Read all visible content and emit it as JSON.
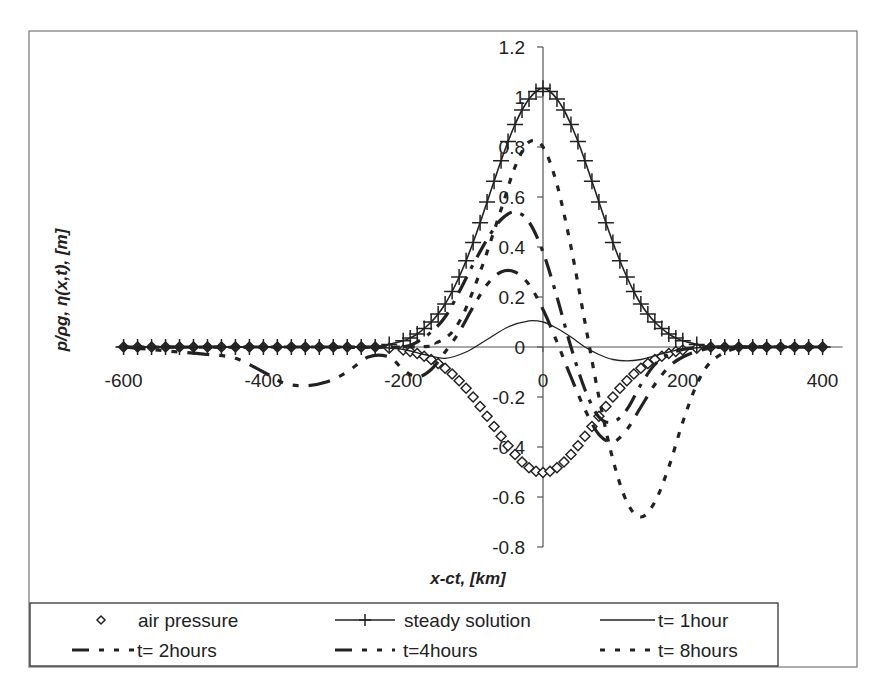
{
  "chart_data": {
    "type": "line",
    "title": "",
    "xlabel": "x-ct,  [km]",
    "ylabel": "p/ρg,  η(x,t),  [m]",
    "xlim": [
      -600,
      400
    ],
    "ylim": [
      -0.8,
      1.2
    ],
    "x_ticks": [
      -600,
      -400,
      -200,
      0,
      200,
      400
    ],
    "x_tick_labels": [
      "-600",
      "-400",
      "-200",
      "0",
      "200",
      "400"
    ],
    "y_ticks": [
      -0.8,
      -0.6,
      -0.4,
      -0.2,
      0,
      0.2,
      0.4,
      0.6,
      0.8,
      1,
      1.2
    ],
    "y_tick_labels": [
      "-0.8",
      "-0.6",
      "-0.4",
      "-0.2",
      "0",
      "0.2",
      "0.4",
      "0.6",
      "0.8",
      "1",
      "1.2"
    ],
    "grid": false,
    "legend_position": "bottom",
    "series": [
      {
        "name": "air pressure",
        "style": "diamond-markers",
        "x": [
          -600,
          -580,
          -560,
          -540,
          -520,
          -500,
          -480,
          -460,
          -440,
          -420,
          -400,
          -380,
          -360,
          -340,
          -320,
          -300,
          -280,
          -260,
          -240,
          -220,
          -200,
          -190,
          -180,
          -170,
          -160,
          -150,
          -140,
          -130,
          -120,
          -110,
          -100,
          -90,
          -80,
          -70,
          -60,
          -50,
          -40,
          -30,
          -20,
          -10,
          0,
          10,
          20,
          30,
          40,
          50,
          60,
          70,
          80,
          90,
          100,
          110,
          120,
          130,
          140,
          150,
          160,
          170,
          180,
          190,
          200,
          220,
          240,
          260,
          280,
          300,
          320,
          340,
          360,
          380,
          400
        ],
        "y": [
          0,
          0,
          0,
          0,
          0,
          0,
          0,
          0,
          0,
          0,
          0,
          0,
          0,
          0,
          0,
          0,
          0,
          0,
          0,
          -0.005,
          -0.012,
          -0.018,
          -0.026,
          -0.037,
          -0.05,
          -0.066,
          -0.085,
          -0.108,
          -0.135,
          -0.165,
          -0.2,
          -0.238,
          -0.277,
          -0.318,
          -0.357,
          -0.395,
          -0.43,
          -0.46,
          -0.483,
          -0.497,
          -0.502,
          -0.497,
          -0.483,
          -0.46,
          -0.43,
          -0.395,
          -0.357,
          -0.318,
          -0.277,
          -0.238,
          -0.2,
          -0.165,
          -0.135,
          -0.108,
          -0.085,
          -0.066,
          -0.05,
          -0.037,
          -0.026,
          -0.018,
          -0.012,
          -0.005,
          0,
          0,
          0,
          0,
          0,
          0,
          0,
          0,
          0
        ]
      },
      {
        "name": "steady solution",
        "style": "solid-plus-markers",
        "x": [
          -600,
          -580,
          -560,
          -540,
          -520,
          -500,
          -480,
          -460,
          -440,
          -420,
          -400,
          -380,
          -360,
          -340,
          -320,
          -300,
          -280,
          -260,
          -240,
          -220,
          -200,
          -190,
          -180,
          -170,
          -160,
          -150,
          -140,
          -130,
          -120,
          -110,
          -100,
          -90,
          -80,
          -70,
          -60,
          -50,
          -40,
          -30,
          -20,
          -10,
          0,
          10,
          20,
          30,
          40,
          50,
          60,
          70,
          80,
          90,
          100,
          110,
          120,
          130,
          140,
          150,
          160,
          170,
          180,
          190,
          200,
          220,
          240,
          260,
          280,
          300,
          320,
          340,
          360,
          380,
          400
        ],
        "y": [
          0,
          0,
          0,
          0,
          0,
          0,
          0,
          0,
          0,
          0,
          0,
          0,
          0,
          0,
          0,
          0,
          0,
          0,
          0,
          0.01,
          0.025,
          0.036,
          0.052,
          0.074,
          0.1,
          0.132,
          0.172,
          0.222,
          0.28,
          0.345,
          0.418,
          0.497,
          0.58,
          0.663,
          0.745,
          0.822,
          0.89,
          0.948,
          0.992,
          1.022,
          1.035,
          1.022,
          0.992,
          0.948,
          0.89,
          0.822,
          0.745,
          0.663,
          0.58,
          0.497,
          0.418,
          0.345,
          0.28,
          0.222,
          0.172,
          0.132,
          0.1,
          0.074,
          0.052,
          0.036,
          0.025,
          0.01,
          0,
          0,
          0,
          0,
          0,
          0,
          0,
          0,
          0
        ]
      },
      {
        "name": "t= 1hour",
        "style": "solid-thin",
        "x": [
          -600,
          -400,
          -250,
          -200,
          -170,
          -140,
          -110,
          -80,
          -50,
          -20,
          0,
          20,
          40,
          60,
          80,
          100,
          120,
          140,
          160,
          180,
          200,
          240,
          300,
          400
        ],
        "y": [
          0,
          0,
          0,
          -0.01,
          -0.03,
          -0.045,
          -0.02,
          0.03,
          0.08,
          0.105,
          0.1,
          0.075,
          0.04,
          0.0,
          -0.03,
          -0.05,
          -0.055,
          -0.05,
          -0.035,
          -0.02,
          -0.008,
          0,
          0,
          0
        ]
      },
      {
        "name": "t= 2hours",
        "style": "long-dash-short-dash",
        "x": [
          -600,
          -560,
          -520,
          -480,
          -440,
          -400,
          -370,
          -340,
          -310,
          -280,
          -250,
          -220,
          -200,
          -180,
          -160,
          -140,
          -120,
          -100,
          -80,
          -60,
          -40,
          -20,
          0,
          20,
          40,
          60,
          80,
          100,
          120,
          140,
          160,
          180,
          200,
          230,
          260,
          300,
          400
        ],
        "y": [
          0,
          -0.01,
          -0.02,
          -0.03,
          -0.045,
          -0.1,
          -0.145,
          -0.155,
          -0.14,
          -0.1,
          -0.04,
          -0.04,
          -0.09,
          -0.12,
          -0.09,
          -0.02,
          0.06,
          0.16,
          0.25,
          0.3,
          0.3,
          0.25,
          0.15,
          0.02,
          -0.12,
          -0.25,
          -0.35,
          -0.38,
          -0.33,
          -0.24,
          -0.15,
          -0.08,
          -0.04,
          -0.01,
          0,
          0,
          0
        ]
      },
      {
        "name": "t=4hours",
        "style": "dash-dot-dot",
        "x": [
          -600,
          -400,
          -250,
          -200,
          -180,
          -160,
          -140,
          -120,
          -100,
          -80,
          -60,
          -40,
          -20,
          0,
          20,
          40,
          60,
          80,
          100,
          120,
          140,
          160,
          180,
          200,
          230,
          260,
          300,
          400
        ],
        "y": [
          0,
          0,
          0,
          0.0,
          0.02,
          0.06,
          0.12,
          0.22,
          0.33,
          0.43,
          0.51,
          0.54,
          0.5,
          0.38,
          0.2,
          0.0,
          -0.17,
          -0.28,
          -0.3,
          -0.25,
          -0.15,
          -0.07,
          -0.03,
          -0.01,
          0,
          0,
          0,
          0
        ]
      },
      {
        "name": "t= 8hours",
        "style": "short-dash",
        "x": [
          -600,
          -200,
          -150,
          -120,
          -90,
          -60,
          -40,
          -20,
          0,
          20,
          40,
          60,
          80,
          100,
          120,
          140,
          160,
          180,
          200,
          220,
          240,
          270,
          300,
          400
        ],
        "y": [
          0,
          0,
          0.02,
          0.1,
          0.3,
          0.55,
          0.72,
          0.82,
          0.8,
          0.65,
          0.4,
          0.1,
          -0.2,
          -0.45,
          -0.62,
          -0.68,
          -0.62,
          -0.48,
          -0.3,
          -0.15,
          -0.06,
          -0.01,
          0,
          0
        ]
      }
    ]
  },
  "legend": {
    "items": [
      {
        "label": "air pressure"
      },
      {
        "label": "steady solution"
      },
      {
        "label": "t= 1hour"
      },
      {
        "label": "t= 2hours"
      },
      {
        "label": "t=4hours"
      },
      {
        "label": "t= 8hours"
      }
    ]
  }
}
